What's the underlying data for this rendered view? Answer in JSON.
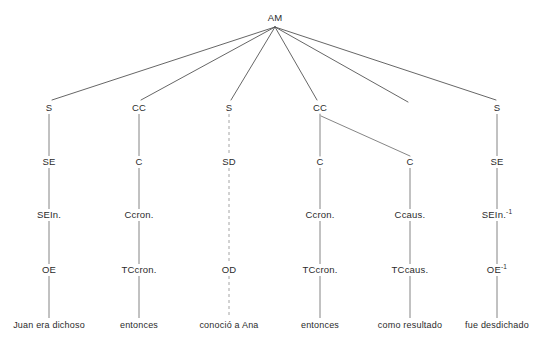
{
  "diagram": {
    "type": "syntactic-tree",
    "line_color": "#555555",
    "dashed_line_color": "#999999",
    "text_color": "#2b2b2b",
    "background": "#ffffff",
    "root": {
      "label": "AM",
      "x": 275,
      "y": 18
    },
    "levels": {
      "root_y": 18,
      "level2_y": 108,
      "level3_y": 162,
      "level4_y": 215,
      "level5_y": 270,
      "leaf_y": 325
    },
    "columns": [
      {
        "id": "col-1",
        "x": 49,
        "dashed": false,
        "nodes": [
          "S",
          "SE",
          "SEIn.",
          "OE"
        ],
        "leaf": "Juan era dichoso"
      },
      {
        "id": "col-2",
        "x": 139,
        "dashed": false,
        "nodes": [
          "CC",
          "C",
          "Ccron.",
          "TCcron."
        ],
        "leaf": "entonces"
      },
      {
        "id": "col-3",
        "x": 229,
        "dashed": true,
        "nodes": [
          "S",
          "SD",
          "",
          "OD"
        ],
        "leaf": "conoció a Ana"
      },
      {
        "id": "col-4",
        "x": 320,
        "dashed": false,
        "nodes": [
          "CC",
          "C",
          "Ccron.",
          "TCcron."
        ],
        "leaf": "entonces"
      },
      {
        "id": "col-5",
        "x": 410,
        "dashed": false,
        "nodes": [
          "",
          "C",
          "Ccaus.",
          "TCcaus."
        ],
        "leaf": "como resultado"
      },
      {
        "id": "col-6",
        "x": 497,
        "dashed": false,
        "nodes": [
          "S",
          "SE",
          "SEIn.",
          "OE"
        ],
        "nodes_sup": [
          "",
          "",
          "-1",
          "-1"
        ],
        "leaf": "fue desdichado"
      }
    ],
    "labels": {
      "root": "AM",
      "n1_1": "S",
      "n1_2": "SE",
      "n1_3": "SEIn.",
      "n1_4": "OE",
      "n1_leaf": "Juan era dichoso",
      "n2_1": "CC",
      "n2_2": "C",
      "n2_3": "Ccron.",
      "n2_4": "TCcron.",
      "n2_leaf": "entonces",
      "n3_1": "S",
      "n3_2": "SD",
      "n3_4": "OD",
      "n3_leaf": "conoció a Ana",
      "n4_1": "CC",
      "n4_2": "C",
      "n4_3": "Ccron.",
      "n4_4": "TCcron.",
      "n4_leaf": "entonces",
      "n5_2": "C",
      "n5_3": "Ccaus.",
      "n5_4": "TCcaus.",
      "n5_leaf": "como resultado",
      "n6_1": "S",
      "n6_2": "SE",
      "n6_3": "SEIn.",
      "n6_4": "OE",
      "n6_leaf": "fue desdichado",
      "sup_minus_one": "-1"
    }
  }
}
